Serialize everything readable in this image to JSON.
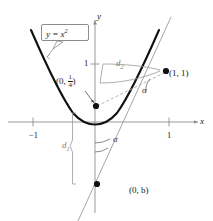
{
  "figure": {
    "kind": "math-diagram",
    "background_color": "#ffffff"
  },
  "axes": {
    "x_label": "x",
    "y_label": "y",
    "ticks": {
      "x": [
        {
          "value": "-1",
          "label": "−1"
        },
        {
          "value": "1",
          "label": "1"
        }
      ],
      "y": [
        {
          "value": "1",
          "label": "1"
        }
      ]
    },
    "axis_color": "#8f8f8f"
  },
  "callout": {
    "equation_lhs": "y = x",
    "equation_exponent": "2",
    "border_color": "#8c8c8c"
  },
  "points": [
    {
      "name": "focus-point",
      "label_prefix": "(0, ",
      "label_numerator": "1",
      "label_denominator": "4",
      "label_suffix": ")",
      "marker_color": "#111111"
    },
    {
      "name": "point-on-parabola",
      "label": "(1, 1)",
      "marker_color": "#111111"
    },
    {
      "name": "y-intercept-point",
      "label": "(0, b)",
      "marker_color": "#111111"
    }
  ],
  "segments": {
    "d2_label": "d",
    "d2_subscript": "2",
    "d1_label": "d",
    "d1_subscript": "1",
    "measure_color": "#7d7d7d"
  },
  "angles": {
    "upper_label": "α",
    "lower_label": "α",
    "color": "#3c3c3c"
  },
  "curves": {
    "parabola_color": "#111111",
    "line_color": "#9a9a9a",
    "dashed_color": "#a8a8a8"
  }
}
